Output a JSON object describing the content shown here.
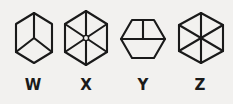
{
  "sheet": {
    "background_color": "#f2f1ef",
    "ink_color": "#1a1a1a",
    "width": 233,
    "height": 104,
    "description": "Four hand-drawn hexagon figures labelled W, X, Y and Z"
  },
  "label_style": {
    "font_size_px": 15,
    "baseline_top_px": 78
  },
  "figures": [
    {
      "id": "w",
      "label": "W",
      "name": "hexagon-figure-w",
      "icon_name": "hexagon-pointy-top-y-junction-icon",
      "orientation": "pointy-top",
      "interior": "y-junction",
      "interior_spokes": 3,
      "center_node": "none",
      "left_px": 6,
      "art_left_px": 7,
      "art_top_px": 11,
      "art_width_px": 42,
      "art_height_px": 54,
      "cell_width_px": 54,
      "stroke_width": 2.1,
      "viewbox": "0 0 42 54",
      "outline_points": "21,2 39,13 39,41 21,52 3,41 3,13",
      "interior_paths": [
        "M21,27 L21,2",
        "M21,27 L39,41",
        "M21,27 L3,41"
      ]
    },
    {
      "id": "x",
      "label": "X",
      "name": "hexagon-figure-x",
      "icon_name": "hexagon-pointy-top-six-spokes-icon",
      "orientation": "pointy-top",
      "interior": "six-spokes",
      "interior_spokes": 6,
      "center_node": "small-open-circle",
      "left_px": 57,
      "art_left_px": 4,
      "art_top_px": 9,
      "art_width_px": 50,
      "art_height_px": 58,
      "cell_width_px": 58,
      "stroke_width": 2.1,
      "viewbox": "0 0 50 58",
      "outline_points": "25,2 46,15 46,43 25,56 4,43 4,15",
      "interior_paths": [
        "M25,29 L25,2",
        "M25,29 L46,15",
        "M25,29 L46,43",
        "M25,29 L25,56",
        "M25,29 L4,43",
        "M25,29 L4,15"
      ],
      "center_node_radius": 2.6
    },
    {
      "id": "y",
      "label": "Y",
      "name": "hexagon-figure-y",
      "icon_name": "hexagon-flat-top-y-junction-icon",
      "orientation": "flat-top",
      "interior": "y-junction",
      "interior_spokes": 3,
      "center_node": "none",
      "left_px": 114,
      "art_left_px": 4,
      "art_top_px": 17,
      "art_width_px": 50,
      "art_height_px": 44,
      "cell_width_px": 58,
      "stroke_width": 2.1,
      "viewbox": "0 0 50 44",
      "outline_points": "14,3 36,3 47,22 36,41 14,41 3,22",
      "interior_paths": [
        "M25,22 L25,3",
        "M25,22 L47,22",
        "M25,22 L3,22",
        "M14,3 L25,22",
        "M36,3 L25,22"
      ],
      "interior_note": "upper-left, upper-right and two lower edges meet at the centre forming a cube"
    },
    {
      "id": "z",
      "label": "Z",
      "name": "hexagon-figure-z",
      "icon_name": "hexagon-pointy-top-six-spokes-icon",
      "orientation": "pointy-top",
      "interior": "six-spokes",
      "interior_spokes": 6,
      "center_node": "none",
      "left_px": 171,
      "art_left_px": 4,
      "art_top_px": 11,
      "art_width_px": 52,
      "art_height_px": 54,
      "cell_width_px": 58,
      "stroke_width": 2.1,
      "viewbox": "0 0 52 54",
      "outline_points": "26,2 48,14 48,40 26,52 4,40 4,14",
      "interior_paths": [
        "M26,27 L26,2",
        "M26,27 L48,14",
        "M26,27 L48,40",
        "M26,27 L26,52",
        "M26,27 L4,40",
        "M26,27 L4,14"
      ]
    }
  ]
}
